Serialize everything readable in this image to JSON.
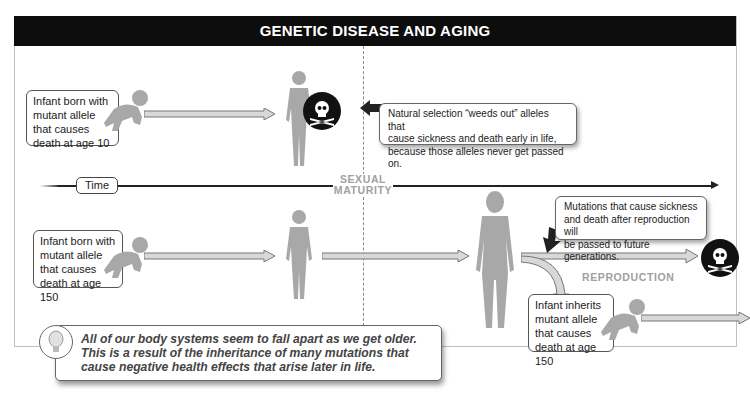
{
  "title": "GENETIC DISEASE AND AGING",
  "row_top": {
    "infant_box": [
      "Infant born with",
      "mutant allele",
      "that causes",
      "death at age 10"
    ],
    "callout": [
      "Natural selection “weeds out” alleles that",
      "cause sickness and death early in life,",
      "because those alleles never get passed on."
    ],
    "icons": [
      "crawling-infant-icon",
      "child-figure-icon",
      "skull-crossbones-icon",
      "pointer-arrow-icon"
    ]
  },
  "timeline": {
    "label": "Time",
    "marker": [
      "SEXUAL",
      "MATURITY"
    ]
  },
  "row_bottom": {
    "infant_box": [
      "Infant born with",
      "mutant allele",
      "that causes",
      "death at age 150"
    ],
    "callout": [
      "Mutations that cause sickness",
      "and death after reproduction will",
      "be passed to future generations."
    ],
    "reproduction_label": "REPRODUCTION",
    "offspring_box": [
      "Infant inherits",
      "mutant allele",
      "that causes",
      "death at age 150"
    ],
    "icons": [
      "crawling-infant-icon",
      "child-figure-icon",
      "adult-woman-icon",
      "skull-crossbones-icon",
      "branch-arrow-icon"
    ]
  },
  "tip": {
    "icon": "lightbulb-icon",
    "text": [
      "All of our body systems seem to fall apart as we get older.",
      "This is a result of the inheritance of many mutations that",
      "cause negative health effects that arise later in life."
    ]
  },
  "colors": {
    "title_bg": "#0d0d0d",
    "figure": "#a8a8a8",
    "label_gray": "#a0a0a0",
    "skull_bg": "#111111"
  }
}
